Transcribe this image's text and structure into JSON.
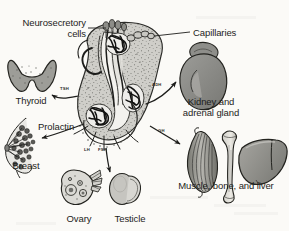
{
  "figure": {
    "background_color": "#fbfaf7",
    "ink_color": "#1d1d1b",
    "organ_fill": "#9a9a96",
    "organ_fill_light": "#c3c2bd",
    "organ_fill_dark": "#7b7b77"
  },
  "callouts": [
    {
      "name": "neurosecretory-cells",
      "text": "Neurosecretory\ncells",
      "x": 8,
      "y": 18,
      "width": 78,
      "align": "rt"
    },
    {
      "name": "capillaries",
      "text": "Capillaries",
      "x": 193,
      "y": 28,
      "width": 70,
      "align": "left"
    }
  ],
  "organs": [
    {
      "name": "thyroid",
      "label": "Thyroid",
      "x": 3,
      "y": 96,
      "width": 56,
      "align": "ctr"
    },
    {
      "name": "breast",
      "label": "Breast",
      "x": 2,
      "y": 161,
      "width": 48,
      "align": "ctr"
    },
    {
      "name": "ovary",
      "label": "Ovary",
      "x": 55,
      "y": 214,
      "width": 48,
      "align": "ctr"
    },
    {
      "name": "testicle",
      "label": "Testicle",
      "x": 105,
      "y": 214,
      "width": 50,
      "align": "ctr"
    },
    {
      "name": "kidney-adrenal-gland",
      "label": "Kidney and\nadrenal gland",
      "x": 172,
      "y": 97,
      "width": 78,
      "align": "ctr"
    },
    {
      "name": "muscle-bone-liver",
      "label": "Muscle, bone, and liver",
      "x": 165,
      "y": 181,
      "width": 122,
      "align": "ctr"
    }
  ],
  "hormones": [
    {
      "name": "tsh",
      "text": "TSH",
      "x": 60,
      "y": 86
    },
    {
      "name": "adh",
      "text": "ADH",
      "x": 152,
      "y": 82
    },
    {
      "name": "prolactin",
      "text": "Prolactin",
      "x": 38,
      "y": 122,
      "large": true
    },
    {
      "name": "lh",
      "text": "LH",
      "x": 84,
      "y": 147
    },
    {
      "name": "fsh",
      "text": "FSH",
      "x": 98,
      "y": 147
    },
    {
      "name": "gh",
      "text": "GH",
      "x": 158,
      "y": 128
    }
  ]
}
